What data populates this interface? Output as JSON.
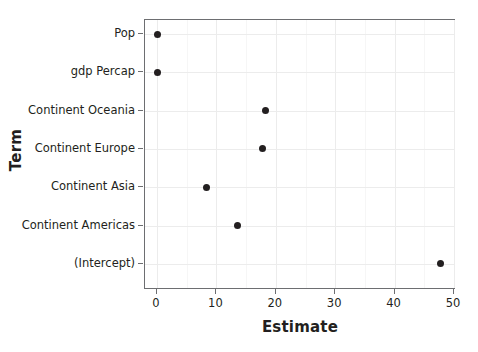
{
  "chart_data": {
    "type": "scatter",
    "title": "",
    "xlabel": "Estimate",
    "ylabel": "Term",
    "xlim": [
      -2.2,
      50
    ],
    "x_ticks": [
      0,
      10,
      20,
      30,
      40,
      50
    ],
    "x_tick_labels": [
      "0",
      "10",
      "20",
      "30",
      "40",
      "50"
    ],
    "categories": [
      "Pop",
      "gdp Percap",
      "Continent Oceania",
      "Continent Europe",
      "Continent Asia",
      "Continent Americas",
      "(Intercept)"
    ],
    "values": [
      0.0,
      0.0,
      18.2,
      17.7,
      8.3,
      13.6,
      47.8
    ],
    "points": [
      {
        "term": "Pop",
        "estimate": 0.0
      },
      {
        "term": "gdp Percap",
        "estimate": 0.0
      },
      {
        "term": "Continent Oceania",
        "estimate": 18.2
      },
      {
        "term": "Continent Europe",
        "estimate": 17.7
      },
      {
        "term": "Continent Asia",
        "estimate": 8.3
      },
      {
        "term": "Continent Americas",
        "estimate": 13.6
      },
      {
        "term": "(Intercept)",
        "estimate": 47.8
      }
    ],
    "grid": true,
    "legend": "none",
    "marker": "filled-circle",
    "marker_color": "#231f20",
    "panel_background": "#ffffff",
    "grid_color": "#ececec",
    "axis_color": "#6d6e71"
  }
}
